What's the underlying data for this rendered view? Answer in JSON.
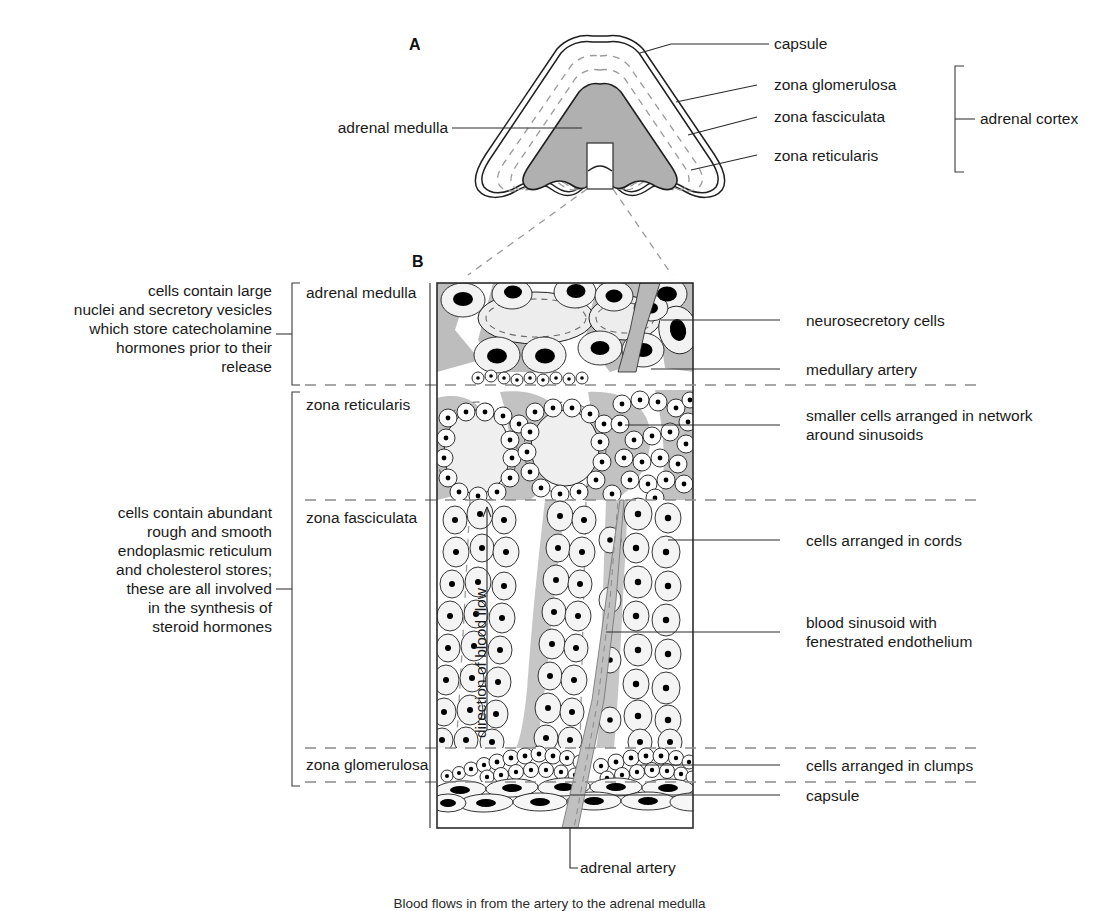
{
  "figure": {
    "panels": [
      {
        "letter": "A",
        "name": "whole-gland-cross-section"
      },
      {
        "letter": "B",
        "name": "magnified-cortex-medulla-detail"
      }
    ]
  },
  "colors": {
    "medulla_fill": "#b3b3b3",
    "cortex_fill": "#ffffff",
    "sinusoid_fill": "#c4c4c4",
    "cell_fill": "#f0f0f0",
    "nucleus_fill": "#000000",
    "outline": "#1f1f1f",
    "dashed_boundary": "#8a8a8a",
    "label_text": "#1a1a1a"
  },
  "panel_a": {
    "letter": "A",
    "labels": {
      "capsule": "capsule",
      "zona_glomerulosa": "zona glomerulosa",
      "zona_fasciculata": "zona fasciculata",
      "zona_reticularis": "zona reticularis",
      "adrenal_medulla": "adrenal medulla",
      "adrenal_cortex": "adrenal cortex"
    }
  },
  "panel_b": {
    "letter": "B",
    "zone_labels": [
      {
        "key": "adrenal-medulla",
        "text": "adrenal medulla"
      },
      {
        "key": "zona-reticularis",
        "text": "zona reticularis"
      },
      {
        "key": "zona-fasciculata",
        "text": "zona fasciculata"
      },
      {
        "key": "zona-glomerulosa",
        "text": "zona glomerulosa"
      }
    ],
    "left_annotations": [
      {
        "key": "medulla-description",
        "text": "cells contain large\nnuclei and secretory vesicles\nwhich store catecholamine\nhormones prior to their\nrelease"
      },
      {
        "key": "cortex-description",
        "text": "cells contain abundant\nrough and smooth\nendoplasmic reticulum\nand cholesterol stores;\nthese are all involved\nin the synthesis of\nsteroid hormones"
      }
    ],
    "right_annotations": [
      {
        "key": "neurosecretory-cells",
        "text": "neurosecretory cells"
      },
      {
        "key": "medullary-artery",
        "text": "medullary artery"
      },
      {
        "key": "smaller-cells-network",
        "text": "smaller cells arranged in network\naround sinusoids"
      },
      {
        "key": "cells-in-cords",
        "text": "cells arranged in cords"
      },
      {
        "key": "blood-sinusoid",
        "text": "blood sinusoid with\nfenestrated endothelium"
      },
      {
        "key": "cells-in-clumps",
        "text": "cells arranged in clumps"
      },
      {
        "key": "capsule",
        "text": "capsule"
      }
    ],
    "blood_flow_label": "direction of blood flow",
    "bottom_label": "adrenal artery"
  },
  "caption": "Blood flows in from the artery to the adrenal medulla"
}
